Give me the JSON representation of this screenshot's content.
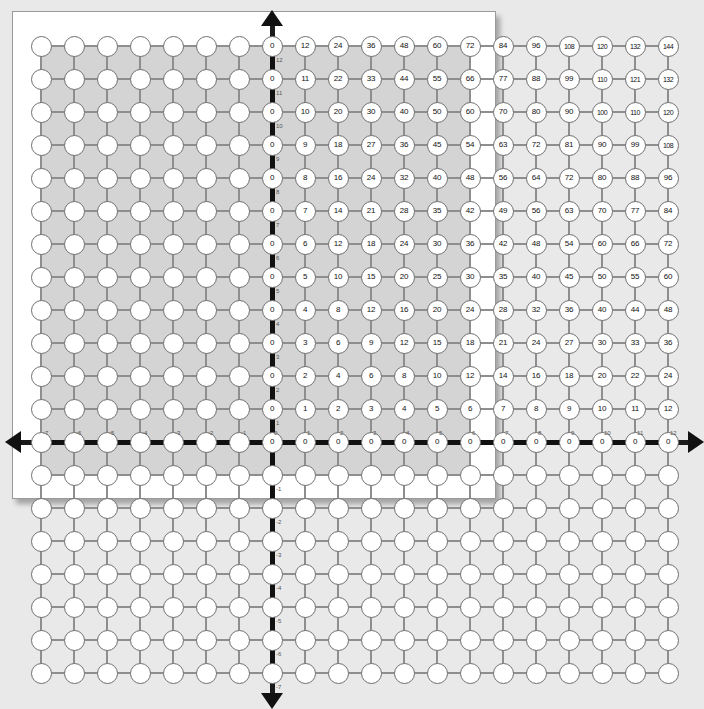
{
  "figure": {
    "background_color": "#e9e9e9",
    "page_color": "#ffffff",
    "board_color": "#d4d4d4",
    "node_color": "#ffffff",
    "axis_color": "#111111",
    "connector_color": "#8e8e8e",
    "tick_label_color": "#555555"
  },
  "chart_data": {
    "type": "heatmap",
    "title": "",
    "xlabel": "",
    "ylabel": "",
    "xlim": [
      -7,
      12
    ],
    "ylim": [
      -7,
      12
    ],
    "grid": true,
    "x_ticks": [
      -7,
      -6,
      -5,
      -4,
      -3,
      -2,
      -1,
      0,
      1,
      2,
      3,
      4,
      5,
      6,
      7,
      8,
      9,
      10,
      11,
      12
    ],
    "y_ticks": [
      -7,
      -6,
      -5,
      -4,
      -3,
      -2,
      -1,
      0,
      1,
      2,
      3,
      4,
      5,
      6,
      7,
      8,
      9,
      10,
      11,
      12
    ],
    "x_tick_labels": [
      "-7",
      "-6",
      "-5",
      "-4",
      "-3",
      "-2",
      "-1",
      "0",
      "1",
      "2",
      "3",
      "4",
      "5",
      "6",
      "7",
      "8",
      "9",
      "10",
      "11",
      "12"
    ],
    "y_tick_labels": [
      "-7",
      "-6",
      "-5",
      "-4",
      "-3",
      "-2",
      "-1",
      "0",
      "1",
      "2",
      "3",
      "4",
      "5",
      "6",
      "7",
      "8",
      "9",
      "10",
      "11",
      "12"
    ],
    "labelled_region": {
      "x_from": 0,
      "x_to": 12,
      "y_from": 0,
      "y_to": 12
    },
    "row_y_values": [
      12,
      11,
      10,
      9,
      8,
      7,
      6,
      5,
      4,
      3,
      2,
      1,
      0
    ],
    "column_x_values": [
      0,
      1,
      2,
      3,
      4,
      5,
      6,
      7,
      8,
      9,
      10,
      11,
      12
    ],
    "rows": [
      {
        "y": 12,
        "values": [
          0,
          12,
          24,
          36,
          48,
          60,
          72,
          84,
          96,
          108,
          120,
          132,
          144
        ]
      },
      {
        "y": 11,
        "values": [
          0,
          11,
          22,
          33,
          44,
          55,
          66,
          77,
          88,
          99,
          110,
          121,
          132
        ]
      },
      {
        "y": 10,
        "values": [
          0,
          10,
          20,
          30,
          40,
          50,
          60,
          70,
          80,
          90,
          100,
          110,
          120
        ]
      },
      {
        "y": 9,
        "values": [
          0,
          9,
          18,
          27,
          36,
          45,
          54,
          63,
          72,
          81,
          90,
          99,
          108
        ]
      },
      {
        "y": 8,
        "values": [
          0,
          8,
          16,
          24,
          32,
          40,
          48,
          56,
          64,
          72,
          80,
          88,
          96
        ]
      },
      {
        "y": 7,
        "values": [
          0,
          7,
          14,
          21,
          28,
          35,
          42,
          49,
          56,
          63,
          70,
          77,
          84
        ]
      },
      {
        "y": 6,
        "values": [
          0,
          6,
          12,
          18,
          24,
          30,
          36,
          42,
          48,
          54,
          60,
          66,
          72
        ]
      },
      {
        "y": 5,
        "values": [
          0,
          5,
          10,
          15,
          20,
          25,
          30,
          35,
          40,
          45,
          50,
          55,
          60
        ]
      },
      {
        "y": 4,
        "values": [
          0,
          4,
          8,
          12,
          16,
          20,
          24,
          28,
          32,
          36,
          40,
          44,
          48
        ]
      },
      {
        "y": 3,
        "values": [
          0,
          3,
          6,
          9,
          12,
          15,
          18,
          21,
          24,
          27,
          30,
          33,
          36
        ]
      },
      {
        "y": 2,
        "values": [
          0,
          2,
          4,
          6,
          8,
          10,
          12,
          14,
          16,
          18,
          20,
          22,
          24
        ]
      },
      {
        "y": 1,
        "values": [
          0,
          1,
          2,
          3,
          4,
          5,
          6,
          7,
          8,
          9,
          10,
          11,
          12
        ]
      },
      {
        "y": 0,
        "values": [
          0,
          0,
          0,
          0,
          0,
          0,
          0,
          0,
          0,
          0,
          0,
          0,
          0
        ]
      }
    ],
    "blank_quadrants": [
      "II",
      "III",
      "IV"
    ],
    "axes": {
      "x_axis_arrows": [
        "left",
        "right"
      ],
      "y_axis_arrows": [
        "up",
        "down"
      ],
      "style": "dashed-thick-black"
    }
  }
}
